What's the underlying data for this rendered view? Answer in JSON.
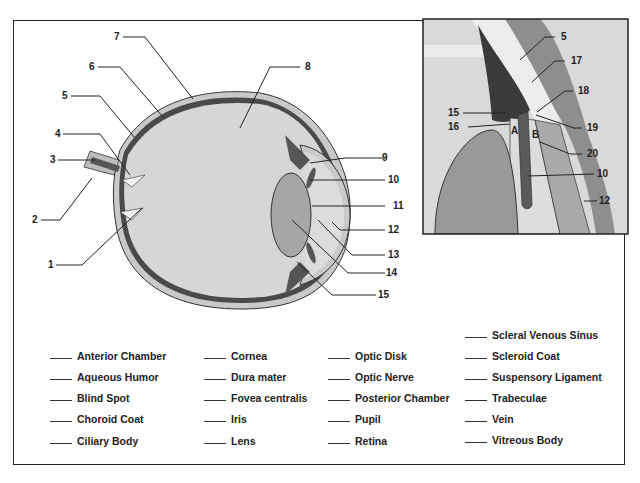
{
  "main_callouts": [
    "1",
    "2",
    "3",
    "4",
    "5",
    "6",
    "7",
    "8",
    "9",
    "10",
    "11",
    "12",
    "13",
    "14",
    "15"
  ],
  "inset_callouts": [
    "5",
    "17",
    "18",
    "15",
    "16",
    "19",
    "20",
    "10",
    "12"
  ],
  "inset_letters": [
    "A",
    "B"
  ],
  "legend": {
    "col1": [
      "Anterior Chamber",
      "Aqueous Humor",
      "Blind Spot",
      "Choroid Coat",
      "Ciliary Body"
    ],
    "col2": [
      "Cornea",
      "Dura mater",
      "Fovea centralis",
      "Iris",
      "Lens"
    ],
    "col3": [
      "Optic Disk",
      "Optic Nerve",
      "Posterior Chamber",
      "Pupil",
      "Retina"
    ],
    "col4": [
      "Scleral Venous Sinus",
      "Scleroid Coat",
      "Suspensory Ligament",
      "Trabeculae",
      "Vein",
      "Vitreous Body"
    ]
  },
  "colors": {
    "vitreous": "#d4d4d4",
    "sclera": "#c9c9c9",
    "choroid": "#555555",
    "lens": "#a8a8a8",
    "inset_bg": "#d8d8d8"
  }
}
